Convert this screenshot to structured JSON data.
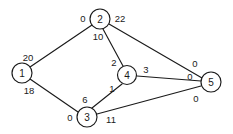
{
  "figure": {
    "name": "flow-network-graph",
    "type": "node-link-diagram",
    "width": 233,
    "height": 134,
    "background_color": "#ffffff",
    "line_color": "#1a1a1a",
    "text_color": "#1a1a1a"
  },
  "nodes": [
    {
      "id": "1",
      "label": "1",
      "cx": 22,
      "cy": 73,
      "r": 10
    },
    {
      "id": "2",
      "label": "2",
      "cx": 100,
      "cy": 19,
      "r": 10
    },
    {
      "id": "3",
      "label": "3",
      "cx": 87,
      "cy": 117,
      "r": 10
    },
    {
      "id": "4",
      "label": "4",
      "cx": 127,
      "cy": 75,
      "r": 9.5
    },
    {
      "id": "5",
      "label": "5",
      "cx": 211,
      "cy": 82,
      "r": 10
    }
  ],
  "edges": [
    {
      "id": "e-1-2",
      "from": "1",
      "to": "2",
      "x1": 30,
      "y1": 67,
      "x2": 92,
      "y2": 25,
      "tail_label": "20",
      "tail_x": 28,
      "tail_y": 57,
      "head_label": "0",
      "head_x": 83,
      "head_y": 18
    },
    {
      "id": "e-1-3",
      "from": "1",
      "to": "3",
      "x1": 30,
      "y1": 79,
      "x2": 78,
      "y2": 112,
      "tail_label": "18",
      "tail_x": 29,
      "tail_y": 90,
      "head_label": "0",
      "head_x": 70,
      "head_y": 117
    },
    {
      "id": "e-2-4",
      "from": "2",
      "to": "4",
      "x1": 103,
      "y1": 29,
      "x2": 123,
      "y2": 66,
      "tail_label": "10",
      "tail_x": 98,
      "tail_y": 36,
      "head_label": "2",
      "head_x": 114,
      "head_y": 62
    },
    {
      "id": "e-2-5",
      "from": "2",
      "to": "5",
      "x1": 109,
      "y1": 24,
      "x2": 202,
      "y2": 78,
      "tail_label": "22",
      "tail_x": 120,
      "tail_y": 18,
      "head_label": "0",
      "head_x": 195,
      "head_y": 63
    },
    {
      "id": "e-3-4",
      "from": "3",
      "to": "4",
      "x1": 92,
      "y1": 108,
      "x2": 122,
      "y2": 84,
      "tail_label": "6",
      "tail_x": 85,
      "tail_y": 99,
      "head_label": "1",
      "head_x": 112,
      "head_y": 88
    },
    {
      "id": "e-3-5",
      "from": "3",
      "to": "5",
      "x1": 97,
      "y1": 114,
      "x2": 201,
      "y2": 86,
      "tail_label": "11",
      "tail_x": 111,
      "tail_y": 119,
      "head_label": "0",
      "head_x": 196,
      "head_y": 98
    },
    {
      "id": "e-4-5",
      "from": "4",
      "to": "5",
      "x1": 137,
      "y1": 76,
      "x2": 201,
      "y2": 81,
      "tail_label": "3",
      "tail_x": 146,
      "tail_y": 69,
      "head_label": "0",
      "head_x": 190,
      "head_y": 76
    }
  ]
}
